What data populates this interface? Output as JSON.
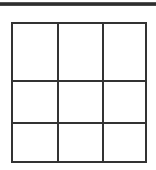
{
  "page": {
    "background_color": "#ffffff",
    "width": 156,
    "height": 170
  },
  "top_rule": {
    "name": "horizontal-rule",
    "color": "#2e2e2e",
    "thickness": 4
  },
  "grid": {
    "title": "",
    "rows": 3,
    "columns": 3,
    "line_color": "#333333",
    "line_width": 2,
    "fill_color": "#ffffff",
    "cells": [
      [
        {
          "text": ""
        },
        {
          "text": ""
        },
        {
          "text": ""
        }
      ],
      [
        {
          "text": ""
        },
        {
          "text": ""
        },
        {
          "text": ""
        }
      ],
      [
        {
          "text": ""
        },
        {
          "text": ""
        },
        {
          "text": ""
        }
      ]
    ]
  }
}
